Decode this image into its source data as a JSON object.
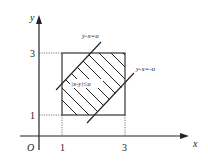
{
  "figure": {
    "axes": {
      "x_label": "x",
      "y_label": "y",
      "origin_label": "O",
      "x_ticks": [
        "1",
        "3"
      ],
      "y_ticks": [
        "1",
        "3"
      ]
    },
    "lines": [
      {
        "label": "y-x=u"
      },
      {
        "label": "y-x=-u"
      }
    ],
    "region_label": "|x-y|≤u",
    "square": {
      "x_min": 1,
      "x_max": 3,
      "y_min": 1,
      "y_max": 3
    },
    "colors": {
      "stroke": "#222222",
      "background": "#ffffff"
    }
  }
}
